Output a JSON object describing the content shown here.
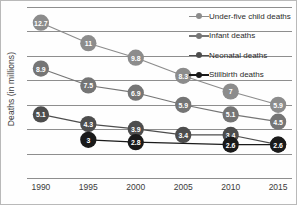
{
  "chart_data": {
    "type": "line",
    "title": "",
    "xlabel": "",
    "ylabel": "Deaths (in millions)",
    "categories": [
      "1990",
      "1995",
      "2000",
      "2005",
      "2010",
      "2015"
    ],
    "x": [
      1990,
      1995,
      2000,
      2005,
      2010,
      2015
    ],
    "ylim": [
      0,
      14
    ],
    "grid": true,
    "y_tick_labels_shown": false,
    "legend_position": "top-right",
    "data_labels_shown": true,
    "series": [
      {
        "name": "Under-five child deaths",
        "color": "#8c8c8c",
        "values": [
          12.7,
          11,
          9.8,
          8.3,
          7,
          5.9
        ],
        "labels": [
          "12.7",
          "11",
          "9.8",
          "8.3",
          "7",
          "5.9"
        ]
      },
      {
        "name": "Infant deaths",
        "color": "#757575",
        "values": [
          8.9,
          7.5,
          6.9,
          5.9,
          5.1,
          4.5
        ],
        "labels": [
          "8.9",
          "7.5",
          "6.9",
          "5.9",
          "5.1",
          "4.5"
        ]
      },
      {
        "name": "Neonatal deaths",
        "color": "#4d4d4d",
        "values": [
          5.1,
          4.3,
          3.9,
          3.4,
          3.4,
          2.6
        ],
        "labels": [
          "5.1",
          "4.3",
          "3.9",
          "3.4",
          "3.4",
          "2.6"
        ]
      },
      {
        "name": "Stillbirth deaths",
        "color": "#1a1a1a",
        "values": [
          null,
          3,
          2.8,
          null,
          2.6,
          2.6
        ],
        "labels": [
          null,
          "3",
          "2.8",
          null,
          "2.6",
          "2.6"
        ]
      }
    ],
    "gridline_count": 8
  },
  "legend": {
    "items": [
      {
        "label": "Under-five child deaths",
        "color": "#8c8c8c"
      },
      {
        "label": "Infant deaths",
        "color": "#757575"
      },
      {
        "label": "Neonatal deaths",
        "color": "#4d4d4d"
      },
      {
        "label": "Stillbirth deaths",
        "color": "#1a1a1a"
      }
    ]
  }
}
